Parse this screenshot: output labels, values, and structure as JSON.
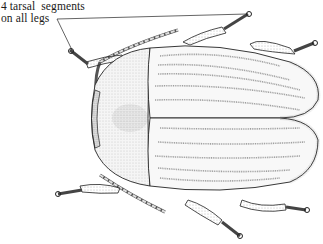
{
  "diagram": {
    "annotation": {
      "line1": "4 tarsal  segments",
      "line2": "on all legs"
    },
    "colors": {
      "ink": "#1a1a1a",
      "body_fill": "#f4f4f4",
      "stipple": "#8a8a8a",
      "background": "#ffffff"
    }
  }
}
